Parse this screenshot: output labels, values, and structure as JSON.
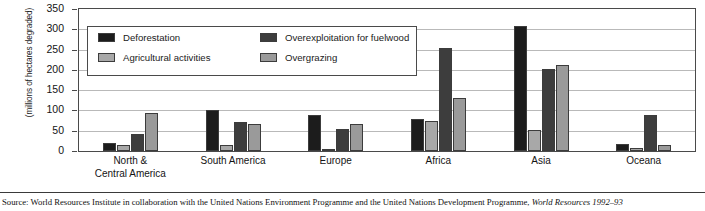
{
  "chart_data": {
    "type": "bar",
    "title": "",
    "xlabel": "",
    "ylabel": "(millions of hectares degraded)",
    "ylim": [
      0,
      350
    ],
    "yticks": [
      0,
      50,
      100,
      150,
      200,
      250,
      300,
      350
    ],
    "ytick_labels": [
      "0",
      "50",
      "100",
      "150",
      "200",
      "250",
      "300",
      "350"
    ],
    "grid": true,
    "legend_position": "upper-left-inside",
    "categories": [
      "North &\nCentral America",
      "South America",
      "Europe",
      "Africa",
      "Asia",
      "Oceana"
    ],
    "series": [
      {
        "name": "Deforestation",
        "color": "#1c1c1c",
        "values": [
          20,
          100,
          88,
          78,
          307,
          18
        ]
      },
      {
        "name": "Agricultural activities",
        "color": "#a8a8a8",
        "values": [
          14,
          15,
          4,
          75,
          52,
          7
        ]
      },
      {
        "name": "Overexploitation for fuelwood",
        "color": "#3d3d3d",
        "values": [
          41,
          72,
          55,
          253,
          203,
          90
        ]
      },
      {
        "name": "Overgrazing",
        "color": "#9a9a9a",
        "values": [
          93,
          67,
          67,
          130,
          212,
          15
        ]
      }
    ]
  },
  "axis": {
    "y_title": "(millions of hectares degraded)"
  },
  "xlabels": [
    {
      "line1": "North &",
      "line2": "Central America"
    },
    {
      "line1": "South America",
      "line2": ""
    },
    {
      "line1": "Europe",
      "line2": ""
    },
    {
      "line1": "Africa",
      "line2": ""
    },
    {
      "line1": "Asia",
      "line2": ""
    },
    {
      "line1": "Oceana",
      "line2": ""
    }
  ],
  "legend": {
    "items": [
      {
        "label": "Deforestation",
        "color": "#1c1c1c"
      },
      {
        "label": "Agricultural activities",
        "color": "#a8a8a8"
      },
      {
        "label": "Overexploitation for fuelwood",
        "color": "#3d3d3d"
      },
      {
        "label": "Overgrazing",
        "color": "#9a9a9a"
      }
    ]
  },
  "source": {
    "prefix": "Source: World Resources Institute in collaboration with the United Nations Environment Programme and the United Nations Development Programme, ",
    "italic": "World Resources 1992–93"
  }
}
